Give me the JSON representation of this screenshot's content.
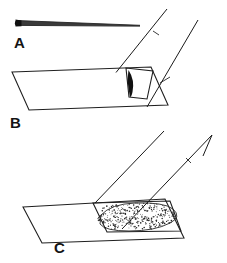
{
  "figure": {
    "background_color": "#ffffff",
    "ink_color": "#1a1a1a",
    "width": 227,
    "height": 263
  },
  "panels": [
    {
      "id": "A",
      "label": "A",
      "label_x": 14,
      "label_y": 48,
      "caption": "Tapered injection needle shown alone in side view",
      "elements": [
        "needle-shaft",
        "needle-hub-dot"
      ]
    },
    {
      "id": "B",
      "label": "B",
      "label_x": 10,
      "label_y": 128,
      "caption": "Needle tip penetrating the flat specimen surface",
      "elements": [
        "specimen-surface",
        "needle-shaft",
        "insertion-wedge",
        "puncture-outline"
      ]
    },
    {
      "id": "C",
      "label": "C",
      "label_x": 54,
      "label_y": 253,
      "caption": "Injected material dispersing as a stippled bolus beneath the surface",
      "elements": [
        "specimen-surface",
        "needle-shaft",
        "injection-bolus",
        "bolus-outline"
      ]
    }
  ],
  "geometry": {
    "panel_a": {
      "needle_top": "M 17 20 L 139 25",
      "needle_bottom": "M 17 25 L 139 26",
      "hub_dot": {
        "cx": 18,
        "cy": 23,
        "r": 2.6
      }
    },
    "panel_b": {
      "surface": "M 12 72 L 151 67 L 168 105 L 29 110 Z",
      "needle_left": "M 116 72 L 166 9",
      "needle_right": "M 146 106 L 197 20",
      "puncture": "M 126 68 L 152 71 L 147 98 L 129 97 Z",
      "wedge": "M 128 70 L 134 80 L 131 96 L 127 88 Z"
    },
    "panel_c": {
      "surface": "M 23 207 L 165 199 L 184 238 L 42 243 Z",
      "inner_frame": "M 93 202 L 169 201 L 180 230 L 106 231 Z",
      "needle_left": "M 95 202 L 163 131",
      "needle_right": "M 123 228 L 213 136",
      "elbow": "M 213 136 L 205 155",
      "bolus": "M 101 214 q 10 -12 34 -13 q 28 -1 38 6 q 9 7 -2 13 q -14 8 -40 8 q -25 0 -30 -6 z"
    }
  },
  "stipple": {
    "description": "random ink dots filling the injection bolus",
    "dot_count": 330,
    "dot_radius": 0.55,
    "color": "#242424"
  },
  "colors": {
    "ink": "#1a1a1a",
    "fill_dark": "#111111",
    "needle_gray": "#3a3a3a",
    "paper": "#ffffff"
  }
}
